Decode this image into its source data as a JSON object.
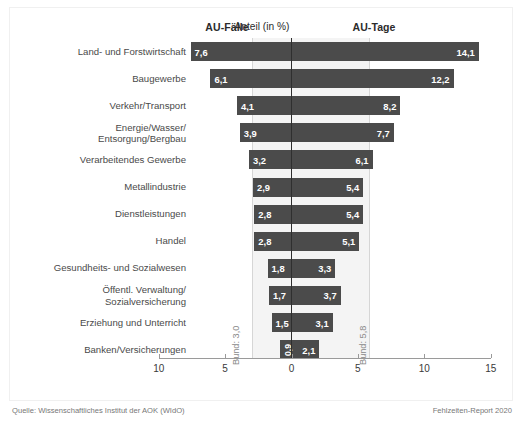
{
  "header": {
    "left_column": "AU-Fälle",
    "right_column": "AU-Tage"
  },
  "axis": {
    "title": "Anteil (in %)",
    "tick_labels": [
      "10",
      "5",
      "0",
      "5",
      "10",
      "15"
    ]
  },
  "annotations": {
    "bund_left": "Bund: 3,0",
    "bund_right": "Bund: 5,8"
  },
  "footer": {
    "source": "Quelle: Wissenschaftliches Institut der AOK (WIdO)",
    "report": "Fehlzeiten-Report 2020"
  },
  "chart_data": {
    "type": "bar",
    "title": "",
    "subtitle": "",
    "xlabel": "Anteil (in %)",
    "ylabel": "",
    "orientation": "horizontal-diverging",
    "grid": false,
    "legend_position": "top",
    "xlim": [
      -10,
      15
    ],
    "xticks": [
      -10,
      -5,
      0,
      5,
      10,
      15
    ],
    "xticklabels": [
      "10",
      "5",
      "0",
      "5",
      "10",
      "15"
    ],
    "categories": [
      "Land- und Forstwirtschaft",
      "Baugewerbe",
      "Verkehr/Transport",
      "Energie/Wasser/\nEntsorgung/Bergbau",
      "Verarbeitendes Gewerbe",
      "Metallindustrie",
      "Dienstleistungen",
      "Handel",
      "Gesundheits- und Sozialwesen",
      "Öffentl. Verwaltung/\nSozialversicherung",
      "Erziehung und Unterricht",
      "Banken/Versicherungen"
    ],
    "series": [
      {
        "name": "AU-Fälle",
        "side": "left",
        "values": [
          7.6,
          6.1,
          4.1,
          3.9,
          3.2,
          2.9,
          2.8,
          2.8,
          1.8,
          1.7,
          1.5,
          0.9
        ],
        "labels": [
          "7,6",
          "6,1",
          "4,1",
          "3,9",
          "3,2",
          "2,9",
          "2,8",
          "2,8",
          "1,8",
          "1,7",
          "1,5",
          "0,9"
        ],
        "reference_line": {
          "label": "Bund: 3,0",
          "value": 3.0
        }
      },
      {
        "name": "AU-Tage",
        "side": "right",
        "values": [
          14.1,
          12.2,
          8.2,
          7.7,
          6.1,
          5.4,
          5.4,
          5.1,
          3.3,
          3.7,
          3.1,
          2.1
        ],
        "labels": [
          "14,1",
          "12,2",
          "8,2",
          "7,7",
          "6,1",
          "5,4",
          "5,4",
          "5,1",
          "3,3",
          "3,7",
          "3,1",
          "2,1"
        ],
        "reference_line": {
          "label": "Bund: 5,8",
          "value": 5.8
        }
      }
    ],
    "bar_color": "#4b4b4b",
    "band_color": "#f4f4f4",
    "source": "Quelle: Wissenschaftliches Institut der AOK (WIdO)",
    "report": "Fehlzeiten-Report 2020"
  }
}
